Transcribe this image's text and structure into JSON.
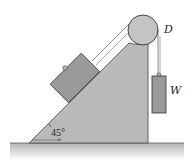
{
  "figure": {
    "type": "mechanics-diagram",
    "labels": {
      "pulley": "D",
      "hanging_weight": "W",
      "angle": "45°"
    },
    "colors": {
      "wedge": "#b9b9b9",
      "block": "#9a9a9a",
      "pulley": "#c4c4c4",
      "ground": "#bdbdbd",
      "outline": "#333333",
      "rope": "#555555"
    },
    "incline_angle_deg": 45
  }
}
